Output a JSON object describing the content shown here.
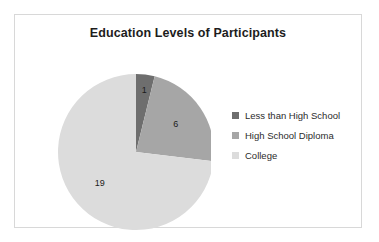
{
  "chart_data": {
    "type": "pie",
    "title": "Education Levels of Participants",
    "categories": [
      "Less than High School",
      "High School Diploma",
      "College"
    ],
    "values": [
      1,
      6,
      19
    ],
    "labels": [
      "1",
      "6",
      "19"
    ],
    "total": 26,
    "colors": [
      "#6e6e6e",
      "#a6a6a6",
      "#dcdcdc"
    ],
    "start_angle_deg": 0,
    "direction": "clockwise",
    "legend_position": "right",
    "grid": false,
    "xlabel": "",
    "ylabel": ""
  },
  "frame": {
    "border_color": "#d8d8d8"
  },
  "legend": {
    "items": [
      {
        "label": "Less than High School",
        "color": "#6e6e6e"
      },
      {
        "label": "High School Diploma",
        "color": "#a6a6a6"
      },
      {
        "label": "College",
        "color": "#dcdcdc"
      }
    ]
  }
}
